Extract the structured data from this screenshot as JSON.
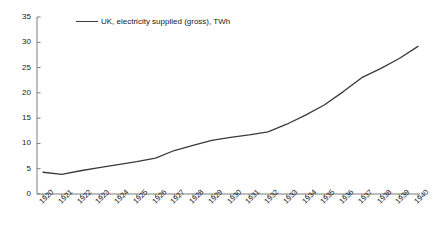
{
  "chart_data": {
    "type": "line",
    "title": "",
    "subtitle": "",
    "xlabel": "",
    "ylabel": "",
    "grid": false,
    "legend_position": "top-left",
    "xlim": [
      1920,
      1940
    ],
    "ylim": [
      0,
      35
    ],
    "y_ticks": [
      0,
      5,
      10,
      15,
      20,
      25,
      30,
      35
    ],
    "x_tick_labels": [
      "1920",
      "1921",
      "1922",
      "1923",
      "1924",
      "1925",
      "1926",
      "1927",
      "1928",
      "1929",
      "1930",
      "1931",
      "1932",
      "1933",
      "1934",
      "1935",
      "1936",
      "1937",
      "1938",
      "1939",
      "1940"
    ],
    "categories": [
      1920,
      1921,
      1922,
      1923,
      1924,
      1925,
      1926,
      1927,
      1928,
      1929,
      1930,
      1931,
      1932,
      1933,
      1934,
      1935,
      1936,
      1937,
      1938,
      1939,
      1940
    ],
    "series": [
      {
        "name": "UK, electricity supplied (gross), TWh",
        "color": "#3a3a3a",
        "values": [
          4.3,
          3.9,
          4.6,
          5.2,
          5.8,
          6.4,
          7.1,
          8.6,
          9.6,
          10.6,
          11.2,
          11.7,
          12.3,
          13.8,
          15.6,
          17.6,
          20.2,
          23.0,
          24.8,
          26.8,
          29.2
        ]
      }
    ]
  },
  "legend": {
    "label": "UK, electricity supplied (gross), TWh"
  },
  "axis": {
    "y_labels": [
      "35",
      "30",
      "25",
      "20",
      "15",
      "10",
      "5",
      "0"
    ],
    "x_labels": [
      "1920",
      "1921",
      "1922",
      "1923",
      "1924",
      "1925",
      "1926",
      "1927",
      "1928",
      "1929",
      "1930",
      "1931",
      "1932",
      "1933",
      "1934",
      "1935",
      "1936",
      "1937",
      "1938",
      "1939",
      "1940"
    ]
  },
  "colors": {
    "line": "#3a3a3a",
    "axis": "#8a8a8a",
    "text": "#1a1a1a",
    "background": "#ffffff"
  }
}
